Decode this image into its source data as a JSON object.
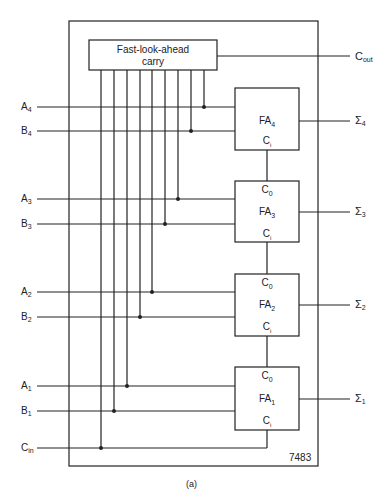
{
  "diagram": {
    "chip_label": "7483",
    "caption": "(a)",
    "carry_block": {
      "line1": "Fast-look-ahead",
      "line2": "carry"
    },
    "carry_out": {
      "main": "C",
      "sub": "out"
    },
    "carry_in": {
      "main": "C",
      "sub": "in"
    },
    "inputs": [
      {
        "main": "A",
        "sub": "4"
      },
      {
        "main": "B",
        "sub": "4"
      },
      {
        "main": "A",
        "sub": "3"
      },
      {
        "main": "B",
        "sub": "3"
      },
      {
        "main": "A",
        "sub": "2"
      },
      {
        "main": "B",
        "sub": "2"
      },
      {
        "main": "A",
        "sub": "1"
      },
      {
        "main": "B",
        "sub": "1"
      }
    ],
    "adders": [
      {
        "name_main": "FA",
        "name_sub": "4",
        "c0": "",
        "ci": "C",
        "ci_sub": "i"
      },
      {
        "name_main": "FA",
        "name_sub": "3",
        "c0": "C",
        "c0_sub": "0",
        "ci": "C",
        "ci_sub": "i"
      },
      {
        "name_main": "FA",
        "name_sub": "2",
        "c0": "C",
        "c0_sub": "0",
        "ci": "C",
        "ci_sub": "i"
      },
      {
        "name_main": "FA",
        "name_sub": "1",
        "c0": "C",
        "c0_sub": "0",
        "ci": "C",
        "ci_sub": "i"
      }
    ],
    "sums": [
      {
        "main": "Σ",
        "sub": "4"
      },
      {
        "main": "Σ",
        "sub": "3"
      },
      {
        "main": "Σ",
        "sub": "2"
      },
      {
        "main": "Σ",
        "sub": "1"
      }
    ]
  }
}
